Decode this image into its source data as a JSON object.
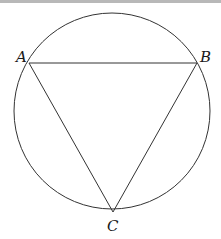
{
  "diagram": {
    "type": "inscribed-triangle-in-circle",
    "circle": {
      "cx": 112,
      "cy": 111,
      "r": 98,
      "stroke": "#333333"
    },
    "points": [
      {
        "name": "A",
        "x": 29,
        "y": 63,
        "label_x": 16,
        "label_y": 62
      },
      {
        "name": "B",
        "x": 197,
        "y": 63,
        "label_x": 200,
        "label_y": 62
      },
      {
        "name": "C",
        "x": 113,
        "y": 212,
        "label_x": 107,
        "label_y": 231
      }
    ],
    "segments": [
      {
        "from": "A",
        "to": "B"
      },
      {
        "from": "A",
        "to": "C"
      },
      {
        "from": "B",
        "to": "C"
      }
    ],
    "labels": {
      "a": "A",
      "b": "B",
      "c": "C"
    }
  }
}
